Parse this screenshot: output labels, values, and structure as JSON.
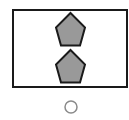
{
  "figure": {
    "width": 129,
    "height": 120,
    "background": "#ffffff",
    "frame": {
      "x": 13,
      "y": 10,
      "width": 114,
      "height": 77,
      "stroke": "#1a1a1a",
      "stroke_width": 2,
      "fill": "#ffffff"
    },
    "shapes": [
      {
        "type": "pentagon",
        "points": "70.5,13 85,27.5 80,45.5 61,45.5 56,27.5",
        "fill": "#999999",
        "stroke": "#1a1a1a",
        "stroke_width": 2
      },
      {
        "type": "pentagon",
        "points": "70.5,50 85,64.5 80,82.5 61,82.5 56,64.5",
        "fill": "#999999",
        "stroke": "#1a1a1a",
        "stroke_width": 2
      }
    ],
    "option_circle": {
      "cx": 71,
      "cy": 107,
      "r": 6,
      "stroke": "#8a8a8a",
      "stroke_width": 1.5,
      "fill": "#ffffff"
    }
  }
}
